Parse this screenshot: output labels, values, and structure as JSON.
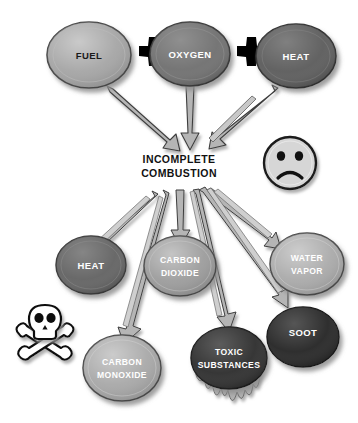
{
  "diagram": {
    "title": "Incomplete Combustion",
    "background_color": "#ffffff",
    "center": {
      "line1": "INCOMPLETE",
      "line2": "COMBUSTION",
      "text_color": "#111111"
    },
    "operators": [
      {
        "symbol": "+",
        "name": "plus-sign-1",
        "color": "#000000"
      },
      {
        "symbol": "+",
        "name": "plus-sign-2",
        "color": "#000000"
      }
    ],
    "reactants": [
      {
        "id": "fuel",
        "label": "FUEL",
        "fill": "#a3a3a3",
        "text_color": "#1a1a1a",
        "stroke": "#4a4a4a",
        "cx": 89,
        "cy": 55,
        "rx": 42,
        "ry": 33
      },
      {
        "id": "oxygen",
        "label": "OXYGEN",
        "fill": "#6f6f6f",
        "text_color": "#ffffff",
        "stroke": "#3a3a3a",
        "cx": 190,
        "cy": 54,
        "rx": 40,
        "ry": 32
      },
      {
        "id": "heat-reactant",
        "label": "HEAT",
        "fill": "#5c5c5c",
        "text_color": "#ffffff",
        "stroke": "#333333",
        "cx": 296,
        "cy": 56,
        "rx": 40,
        "ry": 32
      }
    ],
    "products": [
      {
        "id": "heat-product",
        "label_lines": [
          "HEAT"
        ],
        "fill": "#636363",
        "text_color": "#ffffff",
        "stroke": "#3a3a3a",
        "cx": 91,
        "cy": 265,
        "rx": 35,
        "ry": 29
      },
      {
        "id": "carbon-dioxide",
        "label_lines": [
          "CARBON",
          "DIOXIDE"
        ],
        "fill": "#9a9a9a",
        "text_color": "#ffffff",
        "stroke": "#4a4a4a",
        "cx": 180,
        "cy": 266,
        "rx": 36,
        "ry": 30
      },
      {
        "id": "water-vapor",
        "label_lines": [
          "WATER",
          "VAPOR"
        ],
        "fill": "#a8a8a8",
        "text_color": "#ffffff",
        "stroke": "#4a4a4a",
        "cx": 307,
        "cy": 264,
        "rx": 37,
        "ry": 31
      },
      {
        "id": "carbon-monoxide",
        "label_lines": [
          "CARBON",
          "MONOXIDE"
        ],
        "fill": "#a6a6a6",
        "text_color": "#ffffff",
        "stroke": "#4a4a4a",
        "cx": 122,
        "cy": 368,
        "rx": 39,
        "ry": 33
      },
      {
        "id": "toxic-substances",
        "label_lines": [
          "TOXIC",
          "SUBSTANCES"
        ],
        "fill": "#2f2f2f",
        "text_color": "#ffffff",
        "stroke": "#1a1a1a",
        "cx": 229,
        "cy": 358,
        "rx": 38,
        "ry": 31
      },
      {
        "id": "soot",
        "label_lines": [
          "SOOT"
        ],
        "fill": "#282828",
        "text_color": "#ffffff",
        "stroke": "#141414",
        "cx": 303,
        "cy": 337,
        "rx": 36,
        "ry": 30
      }
    ],
    "icons": [
      {
        "id": "sad-face",
        "name": "sad-face-icon",
        "cx": 290,
        "cy": 163,
        "r": 26,
        "fill": "#d6d6d6",
        "stroke": "#1a1a1a"
      },
      {
        "id": "skull-crossbones",
        "name": "skull-crossbones-icon",
        "cx": 45,
        "cy": 340,
        "fill": "#ffffff",
        "stroke": "#111111"
      }
    ],
    "arrow_style": {
      "fill": "#b5b5b5",
      "stroke": "#3d3d3d",
      "shadow": "#bdbdbd"
    },
    "drip": {
      "name": "toxic-drip",
      "fill": "#b0b0b0",
      "stroke": "#6a6a6a"
    }
  }
}
